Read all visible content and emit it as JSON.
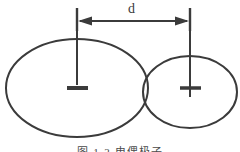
{
  "figure": {
    "title_label": "electric dipole diagram",
    "caption": "图 1-2  电偶极子",
    "background_color": "#ffffff",
    "stroke_color": "#3b3b3b",
    "dimension": {
      "label": "d",
      "arrow_style": "double-headed",
      "left_tick_x": 77,
      "right_tick_x": 190,
      "arrow_y": 21
    },
    "charges": [
      {
        "sign": "−",
        "name": "negative-charge",
        "center_x": 77,
        "center_y": 88,
        "ellipse_rx": 71,
        "ellipse_ry": 49
      },
      {
        "sign": "+",
        "name": "positive-charge",
        "center_x": 190,
        "center_y": 92,
        "ellipse_rx": 47,
        "ellipse_ry": 36
      }
    ]
  }
}
